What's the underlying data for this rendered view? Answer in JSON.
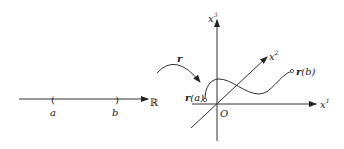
{
  "real_line": {
    "label_a": "a",
    "label_b": "b",
    "set_label": "ℝ",
    "left_bracket": "(",
    "right_bracket": ")"
  },
  "map": {
    "label": "r"
  },
  "space": {
    "axis_x1": "x",
    "axis_x1_sup": "1",
    "axis_x2": "x",
    "axis_x2_sup": "2",
    "axis_x3": "x",
    "axis_x3_sup": "3",
    "origin": "O",
    "start_point": {
      "fn": "r",
      "arg": "(a)"
    },
    "end_point": {
      "fn": "r",
      "arg": "(b)"
    }
  },
  "colors": {
    "stroke": "#333333",
    "background": "#ffffff"
  }
}
